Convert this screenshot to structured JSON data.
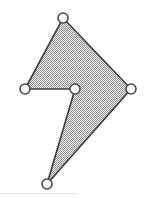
{
  "figure": {
    "type": "polygon",
    "canvas": {
      "width": 144,
      "height": 198
    },
    "background_color": "#ffffff",
    "polygon": {
      "name": "concave-arrow-polygon",
      "fill_pattern": "checkerboard-dither-50",
      "fill_color_light": "#f0f0f0",
      "fill_color_dark": "#9a9a9a",
      "fill_average_color": "#b9b9b9",
      "stroke_color": "#3b3b3b",
      "stroke_width": 1.6,
      "vertex_count": 5,
      "points_string": "63,18 131,89 47,184 75,89 25,89"
    },
    "vertices": [
      {
        "id": "vertex-top",
        "label": "top",
        "x": 63,
        "y": 18,
        "convex": true
      },
      {
        "id": "vertex-right",
        "label": "right",
        "x": 131,
        "y": 89,
        "convex": true
      },
      {
        "id": "vertex-bottom",
        "label": "bottom",
        "x": 47,
        "y": 184,
        "convex": true
      },
      {
        "id": "vertex-middle",
        "label": "middle",
        "x": 75,
        "y": 89,
        "convex": false
      },
      {
        "id": "vertex-left",
        "label": "left",
        "x": 25,
        "y": 89,
        "convex": true
      }
    ],
    "vertex_marker": {
      "shape": "circle",
      "radius": 5,
      "fill_color": "#ffffff",
      "stroke_color": "#4a4a4a",
      "stroke_width": 1.6
    },
    "baseline_rule": {
      "visible": true,
      "x": 0,
      "y": 193,
      "width": 78,
      "color": "#e2e2e2"
    }
  }
}
